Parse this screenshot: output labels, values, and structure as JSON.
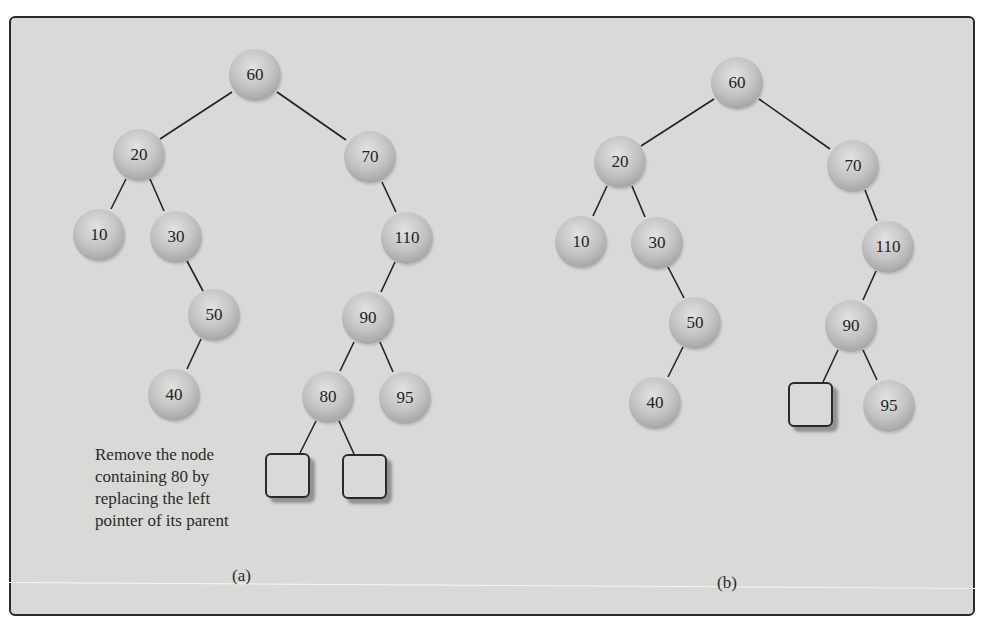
{
  "figure": {
    "background_color": "#d9d9d7",
    "node_color": "#b8b8b8",
    "edge_color": "#222222"
  },
  "panel_a": {
    "label": "(a)",
    "caption_lines": [
      "Remove the node",
      "containing 80 by",
      "replacing the left",
      "pointer of its parent"
    ],
    "nodes": [
      {
        "id": "a60",
        "value": "60",
        "x": 255,
        "y": 75
      },
      {
        "id": "a20",
        "value": "20",
        "x": 139,
        "y": 155
      },
      {
        "id": "a70",
        "value": "70",
        "x": 370,
        "y": 157
      },
      {
        "id": "a10",
        "value": "10",
        "x": 99,
        "y": 235
      },
      {
        "id": "a30",
        "value": "30",
        "x": 176,
        "y": 237
      },
      {
        "id": "a110",
        "value": "110",
        "x": 407,
        "y": 238
      },
      {
        "id": "a50",
        "value": "50",
        "x": 214,
        "y": 315
      },
      {
        "id": "a90",
        "value": "90",
        "x": 368,
        "y": 318
      },
      {
        "id": "a40",
        "value": "40",
        "x": 174,
        "y": 395
      },
      {
        "id": "a80",
        "value": "80",
        "x": 328,
        "y": 397
      },
      {
        "id": "a95",
        "value": "95",
        "x": 405,
        "y": 398
      }
    ],
    "null_boxes": [
      {
        "id": "a80-left",
        "x": 265,
        "y": 453
      },
      {
        "id": "a80-right",
        "x": 342,
        "y": 454
      }
    ]
  },
  "panel_b": {
    "label": "(b)",
    "nodes": [
      {
        "id": "b60",
        "value": "60",
        "x": 737,
        "y": 83
      },
      {
        "id": "b20",
        "value": "20",
        "x": 620,
        "y": 162
      },
      {
        "id": "b70",
        "value": "70",
        "x": 853,
        "y": 166
      },
      {
        "id": "b10",
        "value": "10",
        "x": 581,
        "y": 242
      },
      {
        "id": "b30",
        "value": "30",
        "x": 657,
        "y": 243
      },
      {
        "id": "b110",
        "value": "110",
        "x": 888,
        "y": 247
      },
      {
        "id": "b50",
        "value": "50",
        "x": 695,
        "y": 323
      },
      {
        "id": "b90",
        "value": "90",
        "x": 851,
        "y": 326
      },
      {
        "id": "b40",
        "value": "40",
        "x": 655,
        "y": 403
      },
      {
        "id": "b95",
        "value": "95",
        "x": 889,
        "y": 406
      }
    ],
    "null_boxes": [
      {
        "id": "b90-left",
        "x": 788,
        "y": 382
      }
    ]
  }
}
